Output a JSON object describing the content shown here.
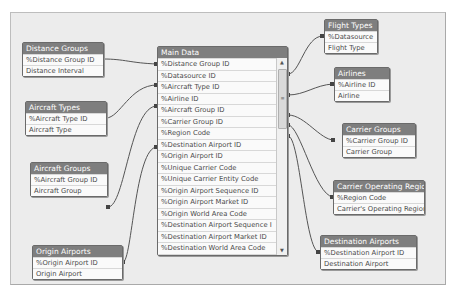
{
  "tables": {
    "distance_groups": {
      "title": "Distance Groups",
      "fields": [
        "%Distance Group ID",
        "Distance Interval"
      ]
    },
    "aircraft_types": {
      "title": "Aircraft Types",
      "fields": [
        "%Aircraft Type ID",
        "Aircraft Type"
      ]
    },
    "aircraft_groups": {
      "title": "Aircraft Groups",
      "fields": [
        "%Aircraft Group ID",
        "Aircraft Group"
      ]
    },
    "origin_airports": {
      "title": "Origin Airports",
      "fields": [
        "%Origin Airport ID",
        "Origin Airport"
      ]
    },
    "flight_types": {
      "title": "Flight Types",
      "fields": [
        "%Datasource",
        "Flight Type"
      ]
    },
    "airlines": {
      "title": "Airlines",
      "fields": [
        "%Airline ID",
        "Airline"
      ]
    },
    "carrier_groups": {
      "title": "Carrier Groups",
      "fields": [
        "%Carrier Group ID",
        "Carrier Group"
      ]
    },
    "carrier_operating_region": {
      "title": "Carrier Operating Region",
      "fields": [
        "%Region Code",
        "Carrier's Operating Region"
      ]
    },
    "destination_airports": {
      "title": "Destination Airports",
      "fields": [
        "%Destination Airport ID",
        "Destination Airport"
      ]
    },
    "main_data": {
      "title": "Main Data",
      "fields": [
        "%Distance Group ID",
        "%Datasource ID",
        "%Aircraft Type ID",
        "%Airline ID",
        "%Aircraft Group ID",
        "%Carrier Group ID",
        "%Region Code",
        "%Destination Airport ID",
        "%Origin Airport ID",
        "%Unique Carrier Code",
        "%Unique Carrier Entity Code",
        "%Origin Airport Sequence ID",
        "%Origin Airport Market ID",
        "%Origin World Area Code",
        "%Destination Airport Sequence I",
        "%Destination Airport Market ID",
        "%Destination World Area Code",
        "%Aircraft Configuration ID"
      ],
      "scroll_up": "▲",
      "scroll_down": "▼",
      "scroll_grip": "≡"
    }
  },
  "colors": {
    "canvas": "#ececec",
    "header": "#7e7e7e",
    "link": "#555555"
  }
}
